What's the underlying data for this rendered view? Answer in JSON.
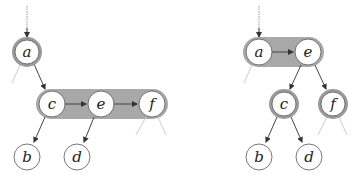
{
  "colors": {
    "edge": "#444444",
    "halo": "#9a9a9a",
    "capsule": "#a8a8a8",
    "node_fill": "#ffffff",
    "node_stroke": "#555555",
    "stub": "#c8c8c8"
  },
  "left_tree": {
    "nodes": [
      {
        "id": "a",
        "label": "a",
        "x": 27,
        "y": 52,
        "halo": true
      },
      {
        "id": "c",
        "label": "c",
        "x": 52,
        "y": 104,
        "halo": false
      },
      {
        "id": "e",
        "label": "e",
        "x": 101,
        "y": 104,
        "halo": false
      },
      {
        "id": "f",
        "label": "f",
        "x": 152,
        "y": 104,
        "halo": false
      },
      {
        "id": "b",
        "label": "b",
        "x": 27,
        "y": 157,
        "halo": false
      },
      {
        "id": "d",
        "label": "d",
        "x": 77,
        "y": 157,
        "halo": false
      }
    ],
    "group": [
      "c",
      "e",
      "f"
    ],
    "edges": [
      [
        "a",
        "c"
      ],
      [
        "c",
        "e"
      ],
      [
        "e",
        "f"
      ],
      [
        "c",
        "b"
      ],
      [
        "e",
        "d"
      ]
    ]
  },
  "right_tree": {
    "nodes": [
      {
        "id": "a",
        "label": "a",
        "x": 259,
        "y": 52,
        "halo": false
      },
      {
        "id": "e",
        "label": "e",
        "x": 308,
        "y": 52,
        "halo": false
      },
      {
        "id": "c",
        "label": "c",
        "x": 284,
        "y": 104,
        "halo": true
      },
      {
        "id": "f",
        "label": "f",
        "x": 333,
        "y": 104,
        "halo": true
      },
      {
        "id": "b",
        "label": "b",
        "x": 259,
        "y": 157,
        "halo": false
      },
      {
        "id": "d",
        "label": "d",
        "x": 309,
        "y": 157,
        "halo": false
      }
    ],
    "group": [
      "a",
      "e"
    ],
    "edges": [
      [
        "a",
        "e"
      ],
      [
        "e",
        "c"
      ],
      [
        "e",
        "f"
      ],
      [
        "c",
        "b"
      ],
      [
        "c",
        "d"
      ]
    ]
  }
}
